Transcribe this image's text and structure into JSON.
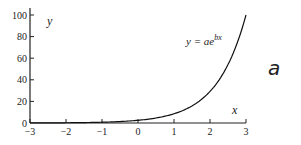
{
  "chart_data": {
    "type": "line",
    "title": "",
    "xlabel": "x",
    "ylabel": "y",
    "xlim": [
      -3,
      3
    ],
    "ylim": [
      0,
      100
    ],
    "x_ticks": [
      -3,
      -2,
      -1,
      0,
      1,
      2,
      3
    ],
    "x_tick_labels": [
      "−3",
      "−2",
      "−1",
      "0",
      "1",
      "2",
      "3"
    ],
    "y_ticks": [
      0,
      20,
      40,
      60,
      80,
      100
    ],
    "y_tick_labels": [
      "0",
      "20",
      "40",
      "60",
      "80",
      "100"
    ],
    "grid": false,
    "annotation": "y = ae^{bx}",
    "series": [
      {
        "name": "y = ae^bx",
        "x": [
          -3,
          -2,
          -1,
          0,
          1,
          2,
          2.5,
          3
        ],
        "values": [
          0.06,
          0.2,
          0.7,
          2.5,
          8.6,
          29.3,
          54.1,
          100
        ]
      }
    ]
  },
  "labels": {
    "x_axis": "x",
    "y_axis": "y",
    "equation_prefix": "y = ae",
    "equation_exp": "bx",
    "panel": "a"
  }
}
